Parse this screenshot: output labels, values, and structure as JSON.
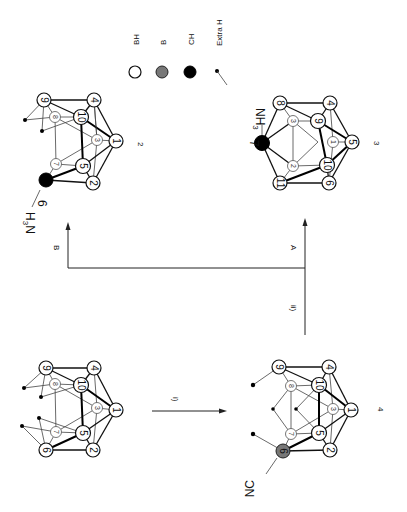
{
  "figure": {
    "orientation": "rotated 90 degrees clockwise",
    "legend": {
      "items": [
        {
          "symbol": "open-circle",
          "label": "BH"
        },
        {
          "symbol": "hatched-circle",
          "label": "B"
        },
        {
          "symbol": "filled-circle",
          "label": "CH"
        },
        {
          "symbol": "dot-with-line",
          "label": "Extra H"
        }
      ]
    },
    "structures": [
      {
        "id": "1",
        "number_label": "",
        "substituent": "",
        "atoms": [
          "1",
          "2",
          "3",
          "4",
          "5",
          "6",
          "7",
          "8",
          "9",
          "10"
        ]
      },
      {
        "id": "2",
        "number_label": "2",
        "substituent": "H3N",
        "substituent_sub": "3",
        "substituent_pre": "H",
        "substituent_post": "N",
        "ch_atom": "6",
        "atoms": [
          "1",
          "2",
          "3",
          "4",
          "5",
          "6",
          "7",
          "8",
          "9",
          "10"
        ]
      },
      {
        "id": "3",
        "number_label": "3",
        "substituent": "NH3",
        "substituent_main": "NH",
        "substituent_sub": "3",
        "ch_atom": "7",
        "atoms": [
          "1",
          "2",
          "3",
          "4",
          "5",
          "6",
          "7",
          "8",
          "9",
          "10",
          "11"
        ]
      },
      {
        "id": "4",
        "number_label": "4",
        "substituent": "NC",
        "atoms": [
          "1",
          "2",
          "3",
          "4",
          "5",
          "6",
          "7",
          "8",
          "9",
          "10"
        ]
      }
    ],
    "arrows": {
      "i": "i)",
      "ii": "ii)",
      "A": "A",
      "B": "B"
    }
  }
}
